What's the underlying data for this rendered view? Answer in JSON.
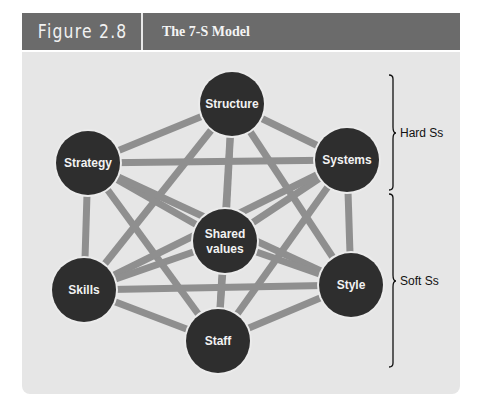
{
  "figure": {
    "number_label": "Figure 2.8",
    "title": "The 7-S Model"
  },
  "colors": {
    "header_bg": "#6b6b6b",
    "panel_bg": "#e6e6e6",
    "node_fill": "#2e2e2e",
    "edge": "#8f8f8f",
    "node_text": "#f2f2f2"
  },
  "nodes": [
    {
      "id": "structure",
      "label": "Structure",
      "x": 232,
      "y": 104
    },
    {
      "id": "strategy",
      "label": "Strategy",
      "x": 88,
      "y": 163
    },
    {
      "id": "systems",
      "label": "Systems",
      "x": 347,
      "y": 160
    },
    {
      "id": "shared_values",
      "label_line1": "Shared",
      "label_line2": "values",
      "x": 225,
      "y": 241
    },
    {
      "id": "skills",
      "label": "Skills",
      "x": 84,
      "y": 290
    },
    {
      "id": "style",
      "label": "Style",
      "x": 351,
      "y": 285
    },
    {
      "id": "staff",
      "label": "Staff",
      "x": 218,
      "y": 341
    }
  ],
  "edges": "complete graph: every node connected to every other node",
  "groups": [
    {
      "label": "Hard Ss",
      "members": [
        "Structure",
        "Strategy",
        "Systems"
      ]
    },
    {
      "label": "Soft Ss",
      "members": [
        "Shared values",
        "Skills",
        "Style",
        "Staff"
      ]
    }
  ]
}
